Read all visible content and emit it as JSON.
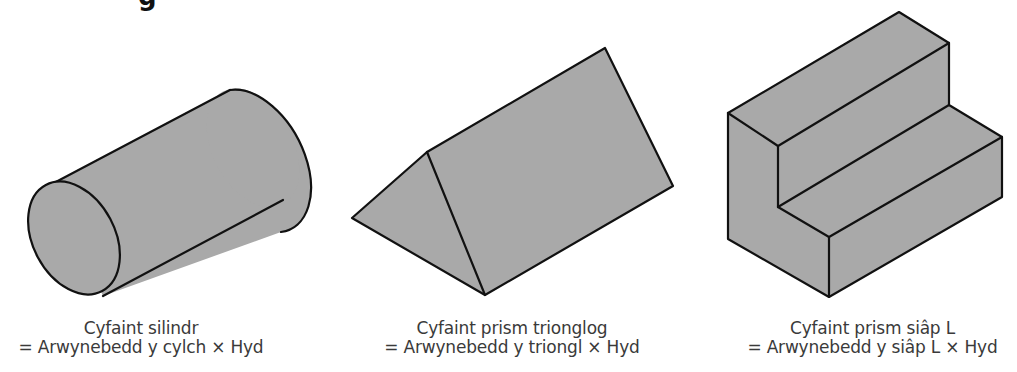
{
  "heading_fragment": "g",
  "colors": {
    "fill": "#a9a9a9",
    "edge": "#111111",
    "text": "#3a3a3a",
    "background": "#ffffff"
  },
  "figures": [
    {
      "id": "cylinder",
      "shape": "cylinder",
      "title": "Cyfaint silindr",
      "formula": "= Arwynebedd y cylch × Hyd"
    },
    {
      "id": "triangular-prism",
      "shape": "triangular prism",
      "title": "Cyfaint prism trionglog",
      "formula": "= Arwynebedd y triongl × Hyd"
    },
    {
      "id": "l-prism",
      "shape": "L-shaped prism",
      "title": "Cyfaint prism siâp L",
      "formula": "= Arwynebedd y siâp L × Hyd"
    }
  ]
}
